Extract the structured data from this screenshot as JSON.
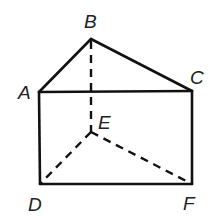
{
  "diagram": {
    "type": "triangular-prism",
    "vertices": {
      "A": {
        "x": 39,
        "y": 92
      },
      "B": {
        "x": 91,
        "y": 39
      },
      "C": {
        "x": 192,
        "y": 91
      },
      "D": {
        "x": 40,
        "y": 184
      },
      "E": {
        "x": 91,
        "y": 132
      },
      "F": {
        "x": 192,
        "y": 184
      }
    },
    "labels": {
      "A": "A",
      "B": "B",
      "C": "C",
      "D": "D",
      "E": "E",
      "F": "F"
    },
    "solid_edges": [
      "AB",
      "BC",
      "AC",
      "AD",
      "CF",
      "DF"
    ],
    "hidden_edges": [
      "BE",
      "DE",
      "EF"
    ],
    "colors": {
      "line": "#111111",
      "label": "#222222",
      "background": "#ffffff"
    }
  }
}
